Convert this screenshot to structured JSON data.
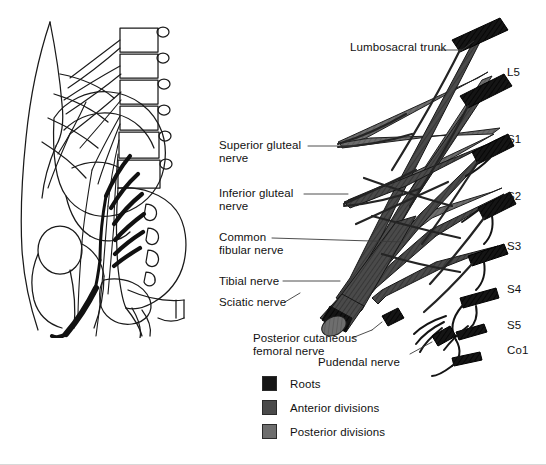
{
  "figure": {
    "background_color": "#ffffff",
    "width": 546,
    "height": 465
  },
  "inset_illustration": {
    "name": "pelvis-lumbosacral-plexus-in-situ",
    "description": "Line drawing of lateral lower torso showing lumbar vertebrae, sacrum, ilium, femur and the lumbosacral plexus nerves in situ",
    "style": "black line art on white"
  },
  "nerve_labels": [
    {
      "id": "lumbosacral-trunk",
      "text": "Lumbosacral trunk",
      "x": 350,
      "y": 47,
      "leader": {
        "x1": 442,
        "y1": 51,
        "x2": 466,
        "y2": 39
      }
    },
    {
      "id": "superior-gluteal",
      "line1": "Superior gluteal",
      "line2": "nerve",
      "x": 219,
      "y": 139,
      "leader": {
        "x1": 310,
        "y1": 146,
        "x2": 334,
        "y2": 146
      }
    },
    {
      "id": "inferior-gluteal",
      "line1": "Inferior gluteal",
      "line2": "nerve",
      "x": 219,
      "y": 187,
      "leader": {
        "x1": 304,
        "y1": 194,
        "x2": 326,
        "y2": 194
      }
    },
    {
      "id": "common-fibular",
      "line1": "Common",
      "line2": "fibular nerve",
      "x": 219,
      "y": 231,
      "leader": {
        "x1": 280,
        "y1": 238,
        "x2": 382,
        "y2": 241
      }
    },
    {
      "id": "tibial-nerve",
      "text": "Tibial nerve",
      "x": 219,
      "y": 275,
      "leader": {
        "x1": 285,
        "y1": 281,
        "x2": 336,
        "y2": 281
      }
    },
    {
      "id": "sciatic-nerve",
      "text": "Sciatic nerve",
      "x": 219,
      "y": 297,
      "leader": {
        "x1": 288,
        "y1": 302,
        "x2": 308,
        "y2": 292
      }
    },
    {
      "id": "posterior-cutaneous-femoral",
      "line1": "Posterior cutaneous",
      "line2": "femoral nerve",
      "x": 253,
      "y": 333,
      "leader": {
        "x1": 358,
        "y1": 339,
        "x2": 382,
        "y2": 327
      }
    },
    {
      "id": "pudendal-nerve",
      "text": "Pudendal nerve",
      "x": 318,
      "y": 357,
      "leader": {
        "x1": 413,
        "y1": 356,
        "x2": 440,
        "y2": 342
      }
    }
  ],
  "root_labels": [
    {
      "id": "L5",
      "text": "L5",
      "x": 507,
      "y": 66
    },
    {
      "id": "S1",
      "text": "S1",
      "x": 507,
      "y": 133
    },
    {
      "id": "S2",
      "text": "S2",
      "x": 507,
      "y": 190
    },
    {
      "id": "S3",
      "text": "S3",
      "x": 507,
      "y": 240
    },
    {
      "id": "S4",
      "text": "S4",
      "x": 507,
      "y": 283
    },
    {
      "id": "S5",
      "text": "S5",
      "x": 507,
      "y": 319
    },
    {
      "id": "Co1",
      "text": "Co1",
      "x": 507,
      "y": 344
    }
  ],
  "legend": {
    "x": 262,
    "y": 376,
    "items": [
      {
        "id": "roots",
        "label": "Roots",
        "color": "#151515"
      },
      {
        "id": "anterior-divisions",
        "label": "Anterior divisions",
        "color": "#4a4a4a"
      },
      {
        "id": "posterior-divisions",
        "label": "Posterior divisions",
        "color": "#6e6e6e"
      }
    ]
  },
  "colors": {
    "roots": "#151515",
    "anterior_divisions": "#4a4a4a",
    "posterior_divisions": "#6e6e6e",
    "outline": "#1a1a1a",
    "leader_line": "#3a3a3a",
    "text": "#111111",
    "background": "#ffffff"
  }
}
